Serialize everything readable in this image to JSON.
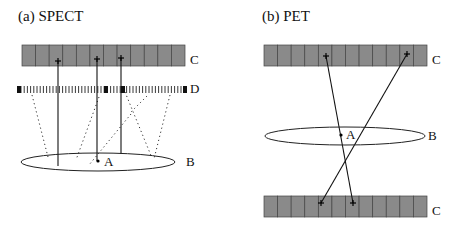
{
  "panels": [
    {
      "id": "spect",
      "title": "(a) SPECT",
      "labels": {
        "crystal": "C",
        "collimator": "D",
        "source": "A",
        "body": "B"
      },
      "crystal": {
        "x": 22,
        "y": 45,
        "w": 163,
        "h": 21,
        "cells": 12
      },
      "collimator": {
        "x": 17,
        "y": 86,
        "w": 170,
        "h": 7
      },
      "ellipse": {
        "cx": 98,
        "cy": 162,
        "rx": 77,
        "ry": 9
      },
      "source_point": {
        "x": 98,
        "y": 161
      },
      "hits": [
        {
          "x": 58,
          "y": 61
        },
        {
          "x": 97,
          "y": 59
        },
        {
          "x": 121,
          "y": 58
        }
      ],
      "rays": [
        {
          "x1": 58,
          "y1": 61,
          "x2": 58,
          "y2": 166
        },
        {
          "x1": 97,
          "y1": 59,
          "x2": 97,
          "y2": 161
        },
        {
          "x1": 121,
          "y1": 58,
          "x2": 121,
          "y2": 154
        }
      ],
      "scattered_rays": [
        {
          "x1": 32,
          "y1": 95,
          "x2": 48,
          "y2": 157
        },
        {
          "x1": 99,
          "y1": 97,
          "x2": 76,
          "y2": 160
        },
        {
          "x1": 131,
          "y1": 114,
          "x2": 89,
          "y2": 165
        },
        {
          "x1": 125,
          "y1": 92,
          "x2": 152,
          "y2": 158
        },
        {
          "x1": 170,
          "y1": 95,
          "x2": 154,
          "y2": 159
        },
        {
          "x1": 147,
          "y1": 96,
          "x2": 131,
          "y2": 112
        }
      ]
    },
    {
      "id": "pet",
      "title": "(b) PET",
      "labels": {
        "crystal_top": "C",
        "crystal_bottom": "C",
        "source": "A",
        "body": "B"
      },
      "crystal_top": {
        "x": 264,
        "y": 45,
        "w": 163,
        "h": 21,
        "cells": 12
      },
      "crystal_bottom": {
        "x": 264,
        "y": 196,
        "w": 163,
        "h": 21,
        "cells": 12
      },
      "ellipse": {
        "cx": 345,
        "cy": 136,
        "rx": 80,
        "ry": 9
      },
      "source_point": {
        "x": 341,
        "y": 135
      },
      "hits_top": [
        {
          "x": 326,
          "y": 56
        },
        {
          "x": 407,
          "y": 54
        }
      ],
      "hits_bottom": [
        {
          "x": 321,
          "y": 203
        },
        {
          "x": 353,
          "y": 203
        }
      ],
      "rays": [
        {
          "x1": 326,
          "y1": 56,
          "x2": 353,
          "y2": 203
        },
        {
          "x1": 407,
          "y1": 54,
          "x2": 321,
          "y2": 203
        }
      ]
    }
  ]
}
